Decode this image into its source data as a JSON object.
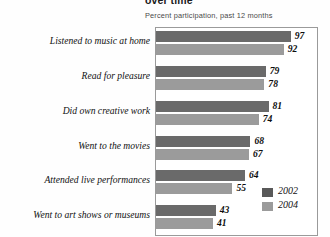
{
  "chart_data": {
    "type": "bar",
    "title": "over time",
    "subtitle": "Percent participation, past 12 months",
    "orientation": "horizontal",
    "xlabel": "",
    "ylabel": "",
    "xlim": [
      0,
      108
    ],
    "grid": false,
    "legend_position": "bottom-right",
    "categories": [
      "Listened to music at home",
      "Read for pleasure",
      "Did own creative work",
      "Went to the movies",
      "Attended live performances",
      "Went to art shows or museums"
    ],
    "series": [
      {
        "name": "2002",
        "color": "#6a6a6a",
        "values": [
          97,
          79,
          81,
          68,
          64,
          43
        ]
      },
      {
        "name": "2004",
        "color": "#9b9b9b",
        "values": [
          92,
          78,
          74,
          67,
          55,
          41
        ]
      }
    ],
    "data_labels": [
      {
        "category": "Listened to music at home",
        "2002": "97",
        "2004": "92"
      },
      {
        "category": "Read for pleasure",
        "2002": "79",
        "2004": "78"
      },
      {
        "category": "Did own creative work",
        "2002": "81",
        "2004": "74"
      },
      {
        "category": "Went to the movies",
        "2002": "68",
        "2004": "67"
      },
      {
        "category": "Attended live performances",
        "2002": "64",
        "2004": "55"
      },
      {
        "category": "Went to art shows or museums",
        "2002": "43",
        "2004": "41"
      }
    ]
  },
  "legend": {
    "items": [
      {
        "label": "2002",
        "color": "#595959"
      },
      {
        "label": "2004",
        "color": "#9b9b9b"
      }
    ]
  },
  "colors": {
    "series_2002": "#6a6a6a",
    "series_2004": "#9b9b9b",
    "frame": "#9a9a9a",
    "text": "#111111",
    "background": "#ffffff"
  }
}
